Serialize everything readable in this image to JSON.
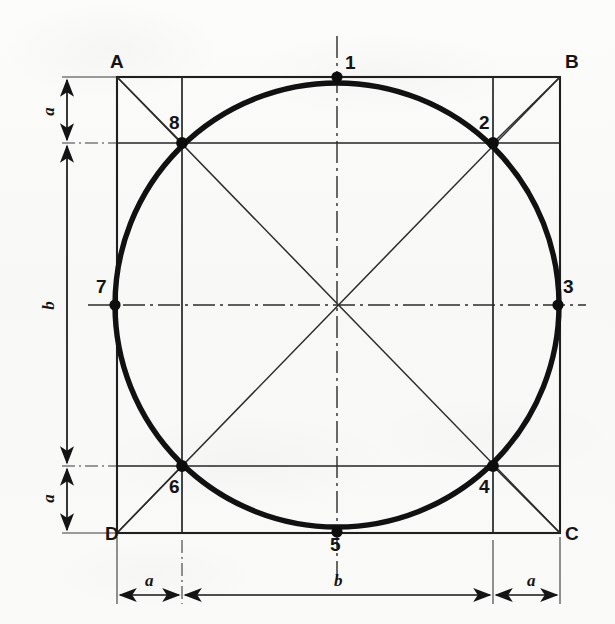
{
  "figure": {
    "corner_labels": [
      {
        "name": "A",
        "text": "A",
        "x": 110,
        "y": 52
      },
      {
        "name": "B",
        "text": "B",
        "x": 565,
        "y": 52
      },
      {
        "name": "C",
        "text": "C",
        "x": 565,
        "y": 524
      },
      {
        "name": "D",
        "text": "D",
        "x": 105,
        "y": 524
      }
    ],
    "point_labels": [
      {
        "name": "1",
        "text": "1",
        "x": 345,
        "y": 53
      },
      {
        "name": "2",
        "text": "2",
        "x": 479,
        "y": 113
      },
      {
        "name": "3",
        "text": "3",
        "x": 563,
        "y": 277
      },
      {
        "name": "4",
        "text": "4",
        "x": 479,
        "y": 477
      },
      {
        "name": "5",
        "text": "5",
        "x": 330,
        "y": 535
      },
      {
        "name": "6",
        "text": "6",
        "x": 169,
        "y": 477
      },
      {
        "name": "7",
        "text": "7",
        "x": 96,
        "y": 277
      },
      {
        "name": "8",
        "text": "8",
        "x": 169,
        "y": 113
      }
    ],
    "dimension_labels": [
      {
        "name": "left-a-top",
        "text": "a",
        "x": 44,
        "y": 110,
        "orient": "vertical"
      },
      {
        "name": "left-b",
        "text": "b",
        "x": 44,
        "y": 297,
        "orient": "vertical"
      },
      {
        "name": "left-a-bottom",
        "text": "a",
        "x": 44,
        "y": 497,
        "orient": "vertical"
      },
      {
        "name": "bottom-a-left",
        "text": "a",
        "x": 145,
        "y": 578,
        "orient": "horizontal"
      },
      {
        "name": "bottom-b",
        "text": "b",
        "x": 334,
        "y": 578,
        "orient": "horizontal"
      },
      {
        "name": "bottom-a-right",
        "text": "a",
        "x": 527,
        "y": 578,
        "orient": "horizontal"
      }
    ],
    "geometry": {
      "square": {
        "left": 117,
        "right": 560,
        "top": 77,
        "bottom": 533
      },
      "inner_square": {
        "left": 182,
        "right": 493,
        "top": 143,
        "bottom": 466
      },
      "circle": {
        "cx": 337,
        "cy": 305,
        "r": 222
      },
      "octagon_points": [
        {
          "id": "1",
          "x": 337,
          "y": 77
        },
        {
          "id": "2",
          "x": 493,
          "y": 143
        },
        {
          "id": "3",
          "x": 558,
          "y": 305
        },
        {
          "id": "4",
          "x": 493,
          "y": 466
        },
        {
          "id": "5",
          "x": 337,
          "y": 532
        },
        {
          "id": "6",
          "x": 182,
          "y": 466
        },
        {
          "id": "7",
          "x": 115,
          "y": 305
        },
        {
          "id": "8",
          "x": 182,
          "y": 143
        }
      ]
    },
    "colors": {
      "ink": "#141414",
      "thin_line": "#2b2b2b",
      "paper": "#fbfbfa"
    }
  }
}
